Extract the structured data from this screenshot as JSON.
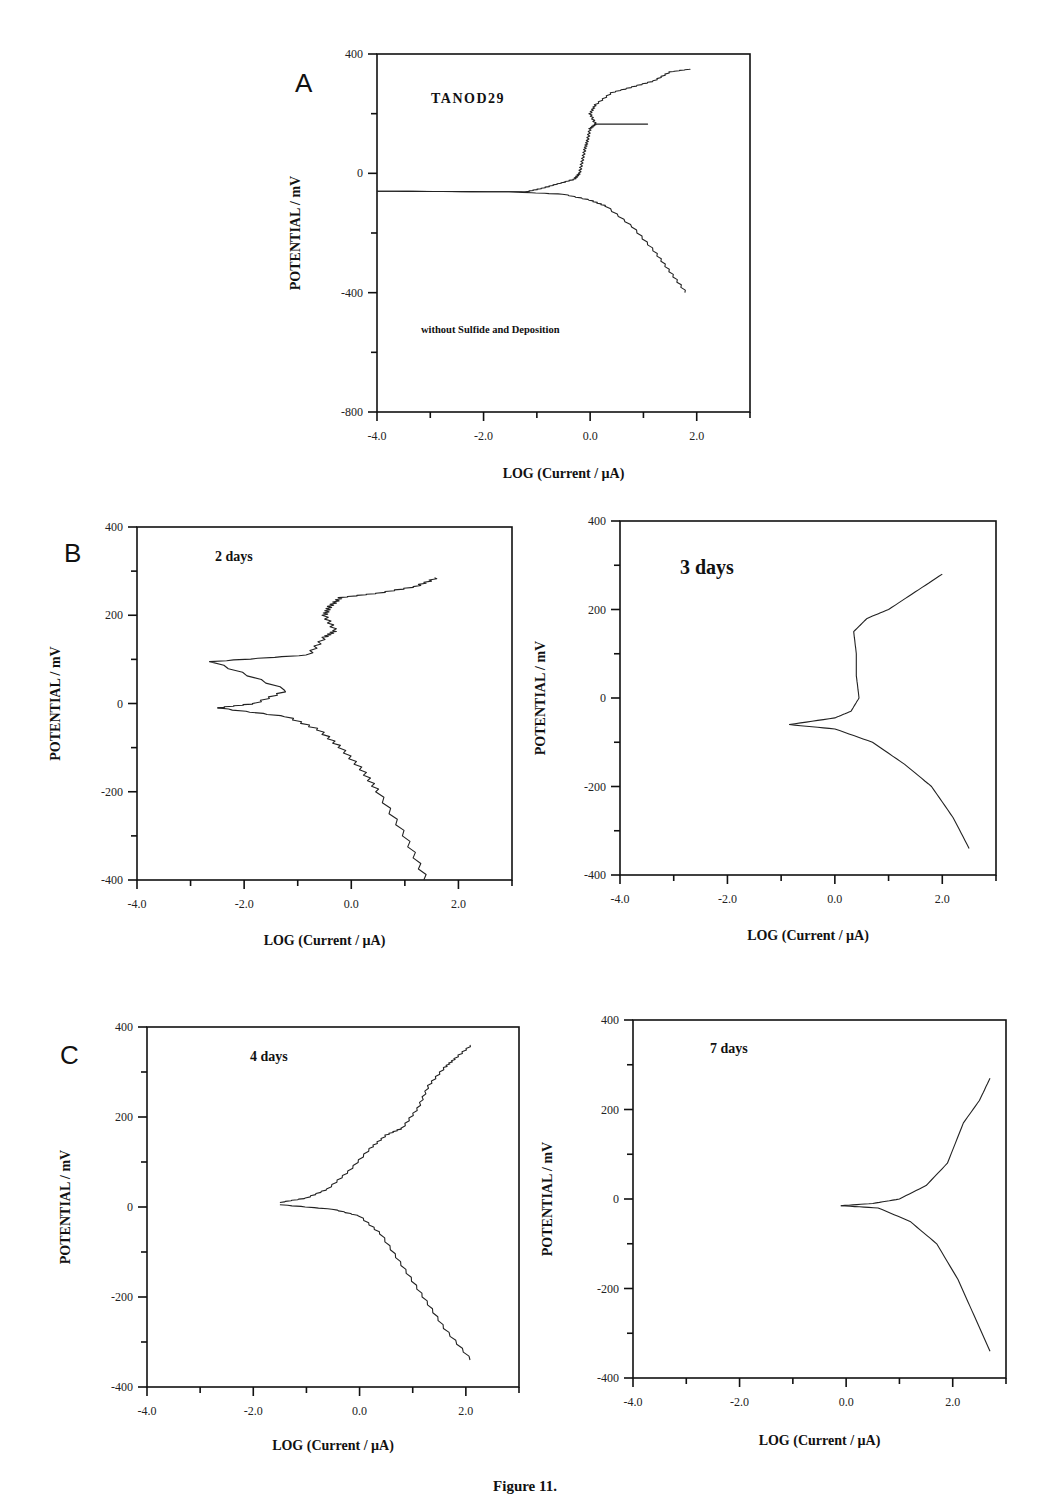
{
  "figure": {
    "caption": "Figure 11.",
    "panel_letters": {
      "A": "A",
      "B": "B",
      "C": "C"
    }
  },
  "chart_data": [
    {
      "id": "A",
      "type": "line",
      "title": "TANOD29",
      "annotation": "without Sulfide and Deposition",
      "xlabel": "LOG (Current / µA)",
      "ylabel": "POTENTIAL / mV",
      "xlim": [
        -4.0,
        3.0
      ],
      "ylim": [
        -800,
        400
      ],
      "xticks": [
        "-4.0",
        "-2.0",
        "0.0",
        "2.0"
      ],
      "yticks": [
        "400",
        "0",
        "-400",
        "-800"
      ],
      "grid": false,
      "series": [
        {
          "name": "anodic",
          "points": [
            [
              -4.0,
              -60
            ],
            [
              -1.2,
              -62
            ],
            [
              -0.9,
              -50
            ],
            [
              -0.6,
              -35
            ],
            [
              -0.3,
              -20
            ],
            [
              -0.2,
              0
            ],
            [
              -0.15,
              40
            ],
            [
              -0.1,
              80
            ],
            [
              -0.05,
              110
            ],
            [
              0.0,
              150
            ],
            [
              0.1,
              165
            ],
            [
              1.1,
              165
            ],
            [
              0.1,
              165
            ],
            [
              0.0,
              200
            ],
            [
              0.1,
              230
            ],
            [
              0.4,
              270
            ],
            [
              0.8,
              290
            ],
            [
              1.2,
              310
            ],
            [
              1.5,
              340
            ],
            [
              1.9,
              350
            ]
          ]
        },
        {
          "name": "cathodic",
          "points": [
            [
              -4.0,
              -60
            ],
            [
              -1.5,
              -62
            ],
            [
              -0.5,
              -70
            ],
            [
              0.0,
              -90
            ],
            [
              0.3,
              -110
            ],
            [
              0.8,
              -180
            ],
            [
              1.2,
              -260
            ],
            [
              1.5,
              -330
            ],
            [
              1.8,
              -400
            ]
          ]
        }
      ]
    },
    {
      "id": "B1",
      "type": "line",
      "title": "2 days",
      "xlabel": "LOG (Current / µA)",
      "ylabel": "POTENTIAL / mV",
      "xlim": [
        -4.0,
        3.0
      ],
      "ylim": [
        -400,
        400
      ],
      "xticks": [
        "-4.0",
        "-2.0",
        "0.0",
        "2.0"
      ],
      "yticks": [
        "400",
        "200",
        "0",
        "-200",
        "-400"
      ],
      "grid": false,
      "series": [
        {
          "name": "polarization",
          "points": [
            [
              -2.5,
              -10
            ],
            [
              -1.8,
              0
            ],
            [
              -1.2,
              30
            ],
            [
              -2.6,
              95
            ],
            [
              -0.8,
              110
            ],
            [
              -0.5,
              150
            ],
            [
              -0.3,
              165
            ],
            [
              -0.5,
              200
            ],
            [
              -0.4,
              220
            ],
            [
              -0.2,
              240
            ],
            [
              0.5,
              250
            ],
            [
              1.2,
              265
            ],
            [
              1.6,
              285
            ]
          ]
        },
        {
          "name": "cathodic",
          "points": [
            [
              -2.5,
              -10
            ],
            [
              -1.2,
              -30
            ],
            [
              -0.6,
              -60
            ],
            [
              -0.2,
              -100
            ],
            [
              0.2,
              -150
            ],
            [
              0.5,
              -200
            ],
            [
              1.0,
              -300
            ],
            [
              1.4,
              -400
            ]
          ]
        }
      ]
    },
    {
      "id": "B2",
      "type": "line",
      "title": "3 days",
      "xlabel": "LOG (Current / µA)",
      "ylabel": "POTENTIAL / mV",
      "xlim": [
        -4.0,
        3.0
      ],
      "ylim": [
        -400,
        400
      ],
      "xticks": [
        "-4.0",
        "-2.0",
        "0.0",
        "2.0"
      ],
      "yticks": [
        "400",
        "200",
        "0",
        "-200",
        "-400"
      ],
      "grid": false,
      "series": [
        {
          "name": "anodic",
          "points": [
            [
              -0.85,
              -60
            ],
            [
              0.0,
              -45
            ],
            [
              0.3,
              -30
            ],
            [
              0.45,
              0
            ],
            [
              0.4,
              50
            ],
            [
              0.4,
              100
            ],
            [
              0.35,
              150
            ],
            [
              0.6,
              180
            ],
            [
              1.0,
              200
            ],
            [
              1.5,
              240
            ],
            [
              2.0,
              280
            ]
          ]
        },
        {
          "name": "cathodic",
          "points": [
            [
              -0.85,
              -60
            ],
            [
              0.0,
              -70
            ],
            [
              0.7,
              -100
            ],
            [
              1.3,
              -150
            ],
            [
              1.8,
              -200
            ],
            [
              2.2,
              -270
            ],
            [
              2.5,
              -340
            ]
          ]
        }
      ]
    },
    {
      "id": "C1",
      "type": "line",
      "title": "4 days",
      "xlabel": "LOG (Current / µA)",
      "ylabel": "POTENTIAL / mV",
      "xlim": [
        -4.0,
        3.0
      ],
      "ylim": [
        -400,
        400
      ],
      "xticks": [
        "-4.0",
        "-2.0",
        "0.0",
        "2.0"
      ],
      "yticks": [
        "400",
        "200",
        "0",
        "-200",
        "-400"
      ],
      "grid": false,
      "series": [
        {
          "name": "anodic",
          "points": [
            [
              -1.5,
              10
            ],
            [
              -1.0,
              20
            ],
            [
              -0.6,
              40
            ],
            [
              -0.2,
              80
            ],
            [
              0.2,
              130
            ],
            [
              0.5,
              160
            ],
            [
              0.8,
              175
            ],
            [
              1.1,
              220
            ],
            [
              1.3,
              270
            ],
            [
              1.6,
              310
            ],
            [
              1.8,
              330
            ],
            [
              2.1,
              360
            ]
          ]
        },
        {
          "name": "cathodic",
          "points": [
            [
              -1.5,
              5
            ],
            [
              -0.5,
              -5
            ],
            [
              0.0,
              -20
            ],
            [
              0.4,
              -60
            ],
            [
              0.8,
              -130
            ],
            [
              1.2,
              -200
            ],
            [
              1.6,
              -270
            ],
            [
              2.1,
              -340
            ]
          ]
        }
      ]
    },
    {
      "id": "C2",
      "type": "line",
      "title": "7 days",
      "xlabel": "LOG (Current / µA)",
      "ylabel": "POTENTIAL / mV",
      "xlim": [
        -4.0,
        3.0
      ],
      "ylim": [
        -400,
        400
      ],
      "xticks": [
        "-4.0",
        "-2.0",
        "0.0",
        "2.0"
      ],
      "yticks": [
        "400",
        "200",
        "0",
        "-200",
        "-400"
      ],
      "grid": false,
      "series": [
        {
          "name": "anodic",
          "points": [
            [
              -0.1,
              -15
            ],
            [
              0.5,
              -10
            ],
            [
              1.0,
              0
            ],
            [
              1.5,
              30
            ],
            [
              1.9,
              80
            ],
            [
              2.2,
              170
            ],
            [
              2.5,
              220
            ],
            [
              2.7,
              270
            ]
          ]
        },
        {
          "name": "cathodic",
          "points": [
            [
              -0.1,
              -15
            ],
            [
              0.6,
              -20
            ],
            [
              1.2,
              -50
            ],
            [
              1.7,
              -100
            ],
            [
              2.1,
              -180
            ],
            [
              2.4,
              -260
            ],
            [
              2.7,
              -340
            ]
          ]
        }
      ]
    }
  ]
}
